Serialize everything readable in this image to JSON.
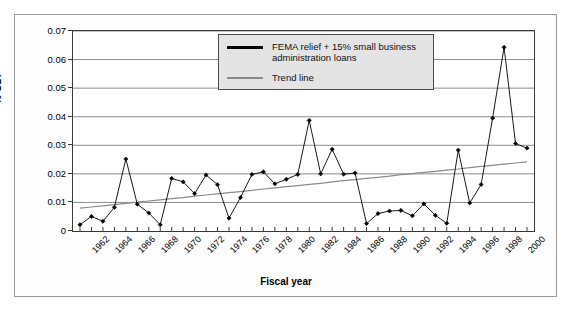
{
  "chart_data": {
    "type": "line",
    "title": "",
    "xlabel": "Fiscal year",
    "ylabel": "% GDP",
    "ylim": [
      0,
      0.07
    ],
    "ytick_values": [
      0,
      0.01,
      0.02,
      0.03,
      0.04,
      0.05,
      0.06,
      0.07
    ],
    "ytick_labels": [
      "0",
      "0.01",
      "0.02",
      "0.03",
      "0.04",
      "0.05",
      "0.06",
      "0.07"
    ],
    "grid": true,
    "legend_position": "top-center",
    "x": [
      1962,
      1963,
      1964,
      1965,
      1966,
      1967,
      1968,
      1969,
      1970,
      1971,
      1972,
      1973,
      1974,
      1975,
      1976,
      1977,
      1978,
      1979,
      1980,
      1981,
      1982,
      1983,
      1984,
      1985,
      1986,
      1987,
      1988,
      1989,
      1990,
      1991,
      1992,
      1993,
      1994,
      1995,
      1996,
      1997,
      1998,
      1999,
      2000,
      2001
    ],
    "xtick_labels": [
      "1962",
      "1964",
      "1966",
      "1968",
      "1970",
      "1972",
      "1974",
      "1976",
      "1978",
      "1980",
      "1982",
      "1984",
      "1986",
      "1988",
      "1990",
      "1992",
      "1994",
      "1996",
      "1998",
      "2000"
    ],
    "series": [
      {
        "name": "FEMA relief + 15% small business administration loans",
        "color": "#000000",
        "marker": "diamond",
        "values": [
          0.0022,
          0.0051,
          0.0034,
          0.0083,
          0.0252,
          0.0094,
          0.0063,
          0.0022,
          0.0184,
          0.0172,
          0.0131,
          0.0196,
          0.0162,
          0.0045,
          0.0117,
          0.0198,
          0.0207,
          0.0165,
          0.0181,
          0.0198,
          0.0387,
          0.02,
          0.0286,
          0.0199,
          0.0203,
          0.0026,
          0.0061,
          0.007,
          0.0072,
          0.0053,
          0.0095,
          0.0055,
          0.0027,
          0.0283,
          0.0098,
          0.0163,
          0.0395,
          0.0643,
          0.0306,
          0.029
        ]
      },
      {
        "name": "Trend line",
        "color": "#8a8a8a",
        "marker": "none",
        "values": [
          0.008,
          0.0084,
          0.0088,
          0.0092,
          0.0097,
          0.0101,
          0.0105,
          0.0109,
          0.0113,
          0.0117,
          0.0122,
          0.0126,
          0.013,
          0.0134,
          0.0138,
          0.0142,
          0.0147,
          0.0151,
          0.0155,
          0.0159,
          0.0163,
          0.0167,
          0.0172,
          0.0176,
          0.018,
          0.0184,
          0.0188,
          0.0192,
          0.0197,
          0.0201,
          0.0205,
          0.0209,
          0.0213,
          0.0217,
          0.0222,
          0.0226,
          0.023,
          0.0234,
          0.0238,
          0.0242
        ]
      }
    ]
  },
  "legend": {
    "items": [
      {
        "label": "FEMA relief + 15% small business administration loans",
        "swatch": "series-line-swatch"
      },
      {
        "label": "Trend line",
        "swatch": "trend-line-swatch"
      }
    ]
  },
  "axes": {
    "y_title": "% GDP",
    "x_title": "Fiscal year"
  },
  "colors": {
    "series": "#000000",
    "trend": "#8a8a8a",
    "grid": "#8c8c8c",
    "frame": "#3a3a3a",
    "legend_bg": "#e4e4e4",
    "page_bg": "#ffffff"
  }
}
